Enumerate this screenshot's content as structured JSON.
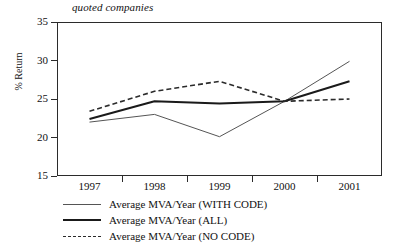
{
  "chart_data": {
    "type": "line",
    "title": "quoted companies",
    "xlabel": "",
    "ylabel": "% Return",
    "categories": [
      "1997",
      "1998",
      "1999",
      "2000",
      "2001"
    ],
    "x_tick_labels": [
      "1997",
      "1998",
      "1999",
      "2000",
      "2001"
    ],
    "y_tick_labels": [
      "35",
      "30",
      "25",
      "20",
      "15"
    ],
    "ylim": [
      15,
      35
    ],
    "ytick_step": 5,
    "grid": false,
    "legend_position": "below",
    "series": [
      {
        "name": "Average MVA/Year (WITH CODE)",
        "style": "thin-solid",
        "color": "#555555",
        "values": [
          22.0,
          23.0,
          20.1,
          24.7,
          29.9
        ]
      },
      {
        "name": "Average MVA/Year (ALL)",
        "style": "thick-solid",
        "color": "#1a1a1a",
        "values": [
          22.4,
          24.7,
          24.4,
          24.7,
          27.3
        ]
      },
      {
        "name": "Average MVA/Year (NO CODE)",
        "style": "dashed",
        "color": "#2b2b2b",
        "values": [
          23.4,
          26.0,
          27.3,
          24.7,
          25.0
        ]
      }
    ]
  },
  "chart": {
    "title": "quoted companies",
    "y_axis_label": "% Return",
    "y_ticks": [
      {
        "label": "35",
        "value": 35
      },
      {
        "label": "30",
        "value": 30
      },
      {
        "label": "25",
        "value": 25
      },
      {
        "label": "20",
        "value": 20
      },
      {
        "label": "15",
        "value": 15
      }
    ],
    "x_ticks": [
      {
        "label": "1997"
      },
      {
        "label": "1998"
      },
      {
        "label": "1999"
      },
      {
        "label": "2000"
      },
      {
        "label": "2001"
      }
    ],
    "legend": [
      {
        "label": "Average MVA/Year (WITH CODE)",
        "style": "thin"
      },
      {
        "label": "Average MVA/Year (ALL)",
        "style": "thick"
      },
      {
        "label": "Average MVA/Year (NO CODE)",
        "style": "dashed"
      }
    ]
  }
}
